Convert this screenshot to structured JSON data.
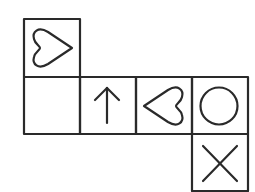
{
  "diagram": {
    "type": "cube-net",
    "stroke_color": "#2a2a2a",
    "background": "#ffffff",
    "cell_size": 56,
    "cells": [
      {
        "id": "top",
        "col": 0,
        "row": 0,
        "symbol": "heart",
        "orientation": "pointing-right"
      },
      {
        "id": "mid-0",
        "col": 0,
        "row": 1,
        "symbol": "blank",
        "orientation": "none"
      },
      {
        "id": "mid-1",
        "col": 1,
        "row": 1,
        "symbol": "arrow",
        "orientation": "up"
      },
      {
        "id": "mid-2",
        "col": 2,
        "row": 1,
        "symbol": "heart",
        "orientation": "pointing-left"
      },
      {
        "id": "mid-3",
        "col": 3,
        "row": 1,
        "symbol": "circle",
        "orientation": "none"
      },
      {
        "id": "bottom",
        "col": 3,
        "row": 2,
        "symbol": "cross",
        "orientation": "none"
      }
    ]
  }
}
